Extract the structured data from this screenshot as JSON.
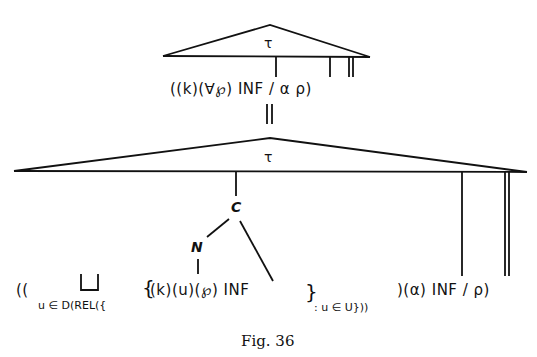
{
  "figure": {
    "caption": "Fig. 36",
    "top_tree": {
      "root_label": "τ",
      "formula": "((k)(∀℘) INF / α ρ)"
    },
    "bottom_tree": {
      "root_label": "τ",
      "node_c": "C",
      "node_n": "N",
      "formula_prefix": "((",
      "union_symbol": "⨆",
      "union_subscript": "u ∈ D(REL({",
      "set_open": "{",
      "set_body": "(k)(u)(℘) INF",
      "set_close": "}",
      "set_subscript": ": u ∈ U}))",
      "formula_suffix": ")(α) INF / ρ)"
    },
    "connector": "∥"
  }
}
